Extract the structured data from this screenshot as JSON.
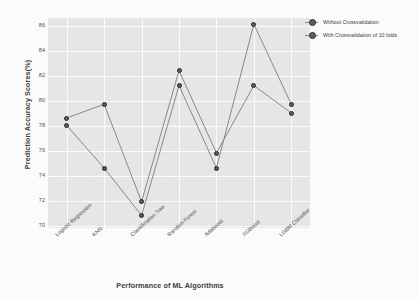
{
  "chart_data": {
    "type": "line",
    "title": "",
    "xlabel": "Performance of ML Algorithms",
    "ylabel": "Prediction Accuracy Scores(%)",
    "categories": [
      "Logistic Regression",
      "KNN",
      "Classification Tree",
      "Random Forest",
      "Adaboost",
      "XGBoost",
      "LGBM Classifier"
    ],
    "series": [
      {
        "name": "Without Crossvalidation",
        "values": [
          78.6,
          79.7,
          71.9,
          82.4,
          75.8,
          81.2,
          79.0
        ]
      },
      {
        "name": "With Crossvalidation of 10 folds",
        "values": [
          78.0,
          74.6,
          70.8,
          81.2,
          74.6,
          86.1,
          79.7
        ]
      }
    ],
    "ylim": [
      69.8,
      86.6
    ],
    "yticks": [
      70,
      72,
      74,
      76,
      78,
      80,
      82,
      84,
      86
    ],
    "ytick_labels": [
      "70",
      "72",
      "74",
      "76",
      "78",
      "80",
      "82",
      "84",
      "86"
    ],
    "grid": true,
    "legend_position": "upper right",
    "marker": "circle",
    "panel_background": "#e2e2e2",
    "grid_color": "#fdfdfd"
  },
  "legend": {
    "items": [
      {
        "label": "Without Crossvalidation",
        "color": "#5a5f68"
      },
      {
        "label": "With Crossvalidation of 10 folds",
        "color": "#6a5c52"
      }
    ]
  },
  "background_text": {
    "heading": "Conclusion",
    "lines": [
      "predicted using machine learning techniques",
      "the models and the accuracy of the",
      "comparison among the various classifiers",
      "and Classification Tree were not as good",
      "gradient boosting methods were observed to",
      "XGBoost provided the highest accuracy",
      "the overall performance was validated using",
      "cross validation. Experimenting with the",
      "data and feature selection improved results"
    ]
  }
}
